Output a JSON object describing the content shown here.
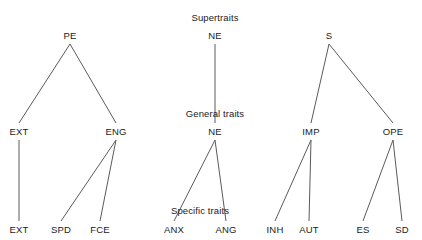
{
  "figure": {
    "background_color": "#ffffff",
    "edge_color": "#5a5a5a",
    "text_color": "#1a1a1a"
  },
  "tier_labels": [
    {
      "id": "supertraits",
      "text": "Supertraits",
      "x": 215,
      "y": 12
    },
    {
      "id": "general-traits",
      "text": "General traits",
      "x": 215,
      "y": 108
    },
    {
      "id": "specific-traits",
      "text": "Specific traits",
      "x": 200,
      "y": 205
    }
  ],
  "trees": [
    {
      "id": "tree-pe",
      "nodes": [
        {
          "id": "pe-root",
          "label": "PE",
          "x": 70,
          "y": 30
        },
        {
          "id": "pe-ext",
          "label": "EXT",
          "x": 19,
          "y": 126
        },
        {
          "id": "pe-eng",
          "label": "ENG",
          "x": 116,
          "y": 126
        },
        {
          "id": "pe-ext-leaf",
          "label": "EXT",
          "x": 19,
          "y": 224
        },
        {
          "id": "pe-spd-leaf",
          "label": "SPD",
          "x": 61,
          "y": 224
        },
        {
          "id": "pe-fce-leaf",
          "label": "FCE",
          "x": 100,
          "y": 224
        }
      ],
      "edges": [
        {
          "from": "pe-root",
          "to": "pe-ext"
        },
        {
          "from": "pe-root",
          "to": "pe-eng"
        },
        {
          "from": "pe-ext",
          "to": "pe-ext-leaf"
        },
        {
          "from": "pe-eng",
          "to": "pe-spd-leaf"
        },
        {
          "from": "pe-eng",
          "to": "pe-fce-leaf"
        }
      ]
    },
    {
      "id": "tree-ne",
      "nodes": [
        {
          "id": "ne-root",
          "label": "NE",
          "x": 215,
          "y": 30
        },
        {
          "id": "ne-general",
          "label": "NE",
          "x": 215,
          "y": 126
        },
        {
          "id": "ne-anx-leaf",
          "label": "ANX",
          "x": 174,
          "y": 224
        },
        {
          "id": "ne-ang-leaf",
          "label": "ANG",
          "x": 226,
          "y": 224
        }
      ],
      "edges": [
        {
          "from": "ne-root",
          "to": "ne-general"
        },
        {
          "from": "ne-general",
          "to": "ne-anx-leaf"
        },
        {
          "from": "ne-general",
          "to": "ne-ang-leaf"
        }
      ]
    },
    {
      "id": "tree-s",
      "nodes": [
        {
          "id": "s-root",
          "label": "S",
          "x": 329,
          "y": 30
        },
        {
          "id": "s-imp",
          "label": "IMP",
          "x": 311,
          "y": 126
        },
        {
          "id": "s-ope",
          "label": "OPE",
          "x": 393,
          "y": 126
        },
        {
          "id": "s-inh-leaf",
          "label": "INH",
          "x": 275,
          "y": 224
        },
        {
          "id": "s-aut-leaf",
          "label": "AUT",
          "x": 309,
          "y": 224
        },
        {
          "id": "s-es-leaf",
          "label": "ES",
          "x": 363,
          "y": 224
        },
        {
          "id": "s-sd-leaf",
          "label": "SD",
          "x": 402,
          "y": 224
        }
      ],
      "edges": [
        {
          "from": "s-root",
          "to": "s-imp"
        },
        {
          "from": "s-root",
          "to": "s-ope"
        },
        {
          "from": "s-imp",
          "to": "s-inh-leaf"
        },
        {
          "from": "s-imp",
          "to": "s-aut-leaf"
        },
        {
          "from": "s-ope",
          "to": "s-es-leaf"
        },
        {
          "from": "s-ope",
          "to": "s-sd-leaf"
        }
      ]
    }
  ]
}
